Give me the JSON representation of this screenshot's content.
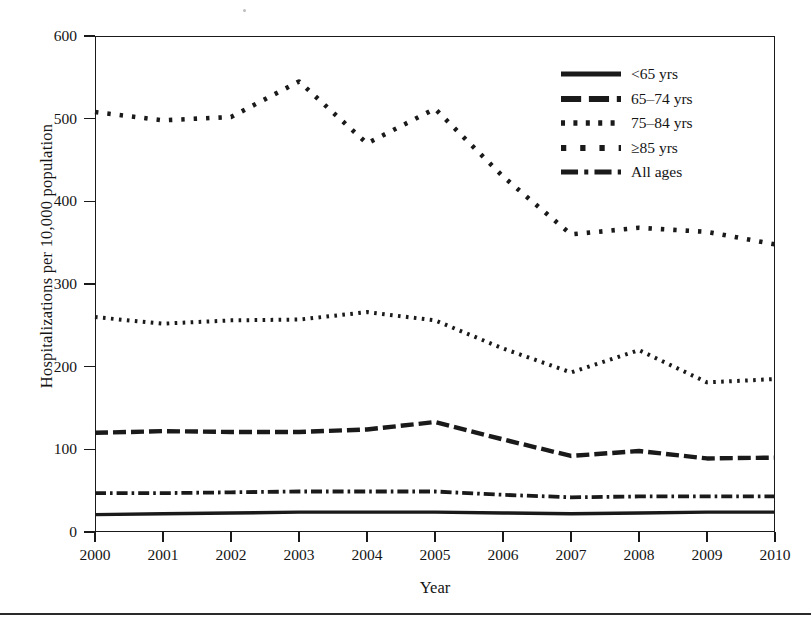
{
  "chart_data": {
    "type": "line",
    "title": "",
    "xlabel": "Year",
    "ylabel": "Hospitalizations per 10,000 population",
    "categories": [
      2000,
      2001,
      2002,
      2003,
      2004,
      2005,
      2006,
      2007,
      2008,
      2009,
      2010
    ],
    "x": [
      2000,
      2001,
      2002,
      2003,
      2004,
      2005,
      2006,
      2007,
      2008,
      2009,
      2010
    ],
    "xlim": [
      2000,
      2010
    ],
    "ylim": [
      0,
      600
    ],
    "yticks": [
      0,
      100,
      200,
      300,
      400,
      500,
      600
    ],
    "xticks": [
      "2000",
      "2001",
      "2002",
      "2003",
      "2004",
      "2005",
      "2006",
      "2007",
      "2008",
      "2009",
      "2010"
    ],
    "grid": false,
    "legend_position": "top-right",
    "series": [
      {
        "name": "<65 yrs",
        "dash": "solid",
        "color": "#1a1a1a",
        "values": [
          21,
          22,
          23,
          24,
          24,
          24,
          23,
          22,
          23,
          24,
          24
        ]
      },
      {
        "name": "65-74 yrs",
        "dash": "long-dash",
        "color": "#1a1a1a",
        "values": [
          120,
          122,
          121,
          121,
          124,
          133,
          112,
          92,
          98,
          89,
          90
        ]
      },
      {
        "name": "75-84 yrs",
        "dash": "dotted",
        "color": "#1a1a1a",
        "values": [
          260,
          252,
          256,
          257,
          266,
          256,
          222,
          193,
          220,
          181,
          185
        ]
      },
      {
        "name": ">=85 yrs",
        "dash": "sparse-dot",
        "color": "#1a1a1a",
        "values": [
          508,
          498,
          502,
          545,
          470,
          512,
          430,
          360,
          368,
          363,
          348
        ]
      },
      {
        "name": "All ages",
        "dash": "dash-dot",
        "color": "#1a1a1a",
        "values": [
          47,
          47,
          48,
          49,
          49,
          49,
          45,
          42,
          43,
          43,
          43
        ]
      }
    ]
  },
  "legend": {
    "items": [
      {
        "label": "<65 yrs",
        "style": "solid"
      },
      {
        "label": "65–74 yrs",
        "style": "long-dash"
      },
      {
        "label": "75–84 yrs",
        "style": "dotted"
      },
      {
        "label": "≥85 yrs",
        "style": "sparse-dot"
      },
      {
        "label": "All ages",
        "style": "dash-dot"
      }
    ]
  },
  "axes": {
    "y_title": "Hospitalizations per 10,000 population",
    "x_title": "Year",
    "y_ticks": [
      "600",
      "500",
      "400",
      "300",
      "200",
      "100",
      "0"
    ],
    "x_ticks": [
      "2000",
      "2001",
      "2002",
      "2003",
      "2004",
      "2005",
      "2006",
      "2007",
      "2008",
      "2009",
      "2010"
    ]
  }
}
